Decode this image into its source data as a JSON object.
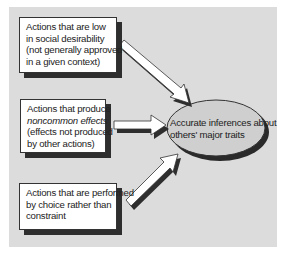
{
  "diagram": {
    "type": "flow-to-outcome",
    "background_color": "#dcdcdc",
    "inputs": [
      {
        "id": "low-social-desirability",
        "lines": [
          "Actions that are low",
          "in social desirability",
          "(not generally approved",
          "in a given context)"
        ]
      },
      {
        "id": "noncommon-effects",
        "lines": [
          "Actions that produce",
          "noncommon effects",
          "(effects not produced",
          "by other actions)"
        ],
        "italic_line_index": 1
      },
      {
        "id": "choice-not-constraint",
        "lines": [
          "Actions that are performed",
          "by choice rather than",
          "constraint"
        ]
      }
    ],
    "outcome": {
      "id": "accurate-inferences",
      "lines": [
        "Accurate inferences about",
        "others' major traits"
      ]
    },
    "edges": [
      {
        "from": "low-social-desirability",
        "to": "accurate-inferences"
      },
      {
        "from": "noncommon-effects",
        "to": "accurate-inferences"
      },
      {
        "from": "choice-not-constraint",
        "to": "accurate-inferences"
      }
    ]
  }
}
